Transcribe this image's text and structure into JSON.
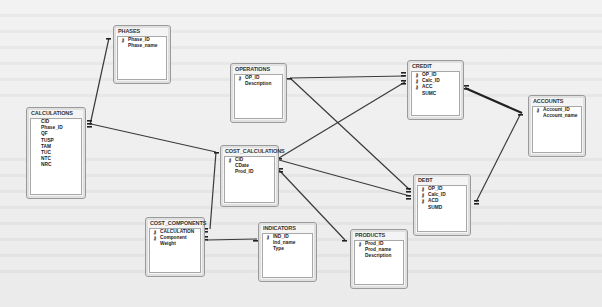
{
  "diagram": {
    "type": "relationships",
    "tables": [
      {
        "id": "phases",
        "name": "PHASES",
        "fields": [
          {
            "name": "Phase_ID",
            "pk": true
          },
          {
            "name": "Phase_name",
            "pk": false
          }
        ]
      },
      {
        "id": "calculations",
        "name": "CALCULATIONS",
        "fields": [
          {
            "name": "CID",
            "pk": false
          },
          {
            "name": "Phase_ID",
            "pk": false
          },
          {
            "name": "QF",
            "pk": false
          },
          {
            "name": "TUSP",
            "pk": false
          },
          {
            "name": "TAM",
            "pk": false
          },
          {
            "name": "TUC",
            "pk": false
          },
          {
            "name": "NTC",
            "pk": false
          },
          {
            "name": "NRC",
            "pk": false
          }
        ]
      },
      {
        "id": "operations",
        "name": "OPERATIONS",
        "fields": [
          {
            "name": "OP_ID",
            "pk": true
          },
          {
            "name": "Description",
            "pk": false
          }
        ]
      },
      {
        "id": "credit",
        "name": "CREDIT",
        "fields": [
          {
            "name": "OP_ID",
            "pk": true
          },
          {
            "name": "Calc_ID",
            "pk": true
          },
          {
            "name": "ACC",
            "pk": true
          },
          {
            "name": "SUMC",
            "pk": false
          }
        ]
      },
      {
        "id": "accounts",
        "name": "ACCOUNTS",
        "fields": [
          {
            "name": "Account_ID",
            "pk": true
          },
          {
            "name": "Account_name",
            "pk": false
          }
        ]
      },
      {
        "id": "cost_calculations",
        "name": "COST_CALCULATIONS",
        "fields": [
          {
            "name": "CID",
            "pk": true
          },
          {
            "name": "CDate",
            "pk": false
          },
          {
            "name": "Prod_ID",
            "pk": false
          }
        ]
      },
      {
        "id": "debt",
        "name": "DEBT",
        "fields": [
          {
            "name": "OP_ID",
            "pk": true
          },
          {
            "name": "Calc_ID",
            "pk": true
          },
          {
            "name": "ACD",
            "pk": true
          },
          {
            "name": "SUMD",
            "pk": false
          }
        ]
      },
      {
        "id": "cost_components",
        "name": "COST_COMPONENTS",
        "fields": [
          {
            "name": "CALCULATION",
            "pk": true
          },
          {
            "name": "Component",
            "pk": true
          },
          {
            "name": "Weight",
            "pk": false
          }
        ]
      },
      {
        "id": "indicators",
        "name": "INDICATORS",
        "fields": [
          {
            "name": "IND_ID",
            "pk": true
          },
          {
            "name": "Ind_name",
            "pk": false
          },
          {
            "name": "Type",
            "pk": false
          }
        ]
      },
      {
        "id": "products",
        "name": "PRODUCTS",
        "fields": [
          {
            "name": "Prod_ID",
            "pk": true
          },
          {
            "name": "Prod_name",
            "pk": false
          },
          {
            "name": "Description",
            "pk": false
          }
        ]
      }
    ],
    "relationships": [
      {
        "from": "PHASES.Phase_ID",
        "to": "CALCULATIONS.Phase_ID",
        "one": "1",
        "many": "∞"
      },
      {
        "from": "COST_CALCULATIONS.CID",
        "to": "CALCULATIONS.CID",
        "one": "1",
        "many": "∞"
      },
      {
        "from": "OPERATIONS.OP_ID",
        "to": "CREDIT.OP_ID",
        "one": "1",
        "many": "∞"
      },
      {
        "from": "OPERATIONS.OP_ID",
        "to": "DEBT.OP_ID",
        "one": "1",
        "many": "∞"
      },
      {
        "from": "COST_CALCULATIONS.CID",
        "to": "CREDIT.Calc_ID",
        "one": "1",
        "many": "∞"
      },
      {
        "from": "COST_CALCULATIONS.CID",
        "to": "DEBT.Calc_ID",
        "one": "1",
        "many": "∞"
      },
      {
        "from": "ACCOUNTS.Account_ID",
        "to": "CREDIT.ACC",
        "one": "1",
        "many": "∞"
      },
      {
        "from": "ACCOUNTS.Account_ID",
        "to": "DEBT.ACD",
        "one": "1",
        "many": "∞"
      },
      {
        "from": "COST_CALCULATIONS.CID",
        "to": "COST_COMPONENTS.CALCULATION",
        "one": "1",
        "many": "∞"
      },
      {
        "from": "INDICATORS.IND_ID",
        "to": "COST_COMPONENTS.Component",
        "one": "1",
        "many": "∞"
      },
      {
        "from": "PRODUCTS.Prod_ID",
        "to": "COST_CALCULATIONS.Prod_ID",
        "one": "1",
        "many": "∞"
      }
    ],
    "key_glyph": "⚷"
  }
}
